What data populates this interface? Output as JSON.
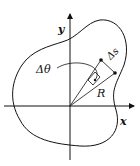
{
  "diagram": {
    "labels": {
      "y_axis": "y",
      "x_axis": "x",
      "delta_theta": "Δθ",
      "delta_s": "Δs",
      "radius": "R"
    },
    "colors": {
      "stroke": "#111111",
      "background": "#ffffff"
    }
  }
}
